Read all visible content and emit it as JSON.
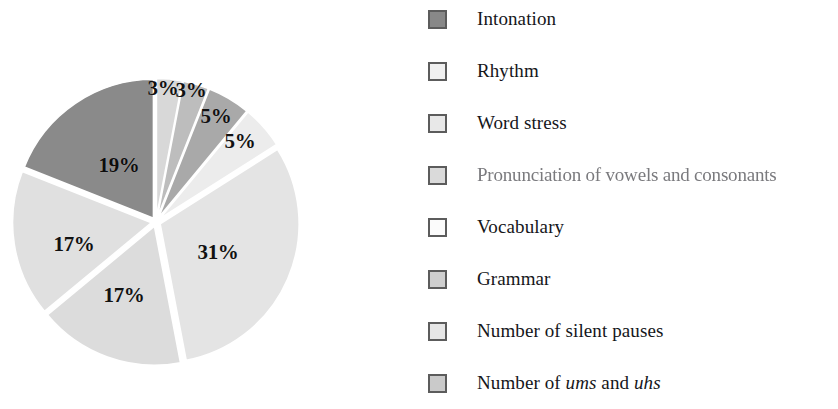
{
  "figure": {
    "background_color": "#ffffff"
  },
  "chart_data": {
    "type": "pie",
    "title": "",
    "subtitle": "",
    "xlabel": "",
    "ylabel": "",
    "grid": false,
    "legend_position": "right",
    "units": "percent",
    "total": 100,
    "start_angle_deg": 0,
    "direction": "clockwise",
    "exploded": true,
    "categories": [
      "Intonation",
      "Rhythm",
      "Word stress",
      "Pronunciation of vowels and consonants",
      "Vocabulary",
      "Grammar",
      "Number of silent pauses",
      "Number of ums and uhs"
    ],
    "values": [
      3,
      3,
      5,
      5,
      31,
      17,
      17,
      19
    ],
    "data_labels": [
      "3%",
      "3%",
      "5%",
      "5%",
      "31%",
      "17%",
      "17%",
      "19%"
    ],
    "colors": [
      "#d8d8d8",
      "#bdbdbd",
      "#a9a9a9",
      "#ececec",
      "#e4e4e4",
      "#dcdcdc",
      "#e0e0e0",
      "#8a8a8a"
    ],
    "slices": [
      {
        "label": "Intonation",
        "value": 3,
        "data_label": "3%",
        "color": "#d8d8d8"
      },
      {
        "label": "Rhythm",
        "value": 3,
        "data_label": "3%",
        "color": "#bdbdbd"
      },
      {
        "label": "Word stress",
        "value": 5,
        "data_label": "5%",
        "color": "#a9a9a9"
      },
      {
        "label": "Pronunciation of vowels and consonants",
        "value": 5,
        "data_label": "5%",
        "color": "#ececec"
      },
      {
        "label": "Vocabulary",
        "value": 31,
        "data_label": "31%",
        "color": "#e4e4e4"
      },
      {
        "label": "Grammar",
        "value": 17,
        "data_label": "17%",
        "color": "#dcdcdc"
      },
      {
        "label": "Number of silent pauses",
        "value": 17,
        "data_label": "17%",
        "color": "#e0e0e0"
      },
      {
        "label": "Number of ums and uhs",
        "value": 19,
        "data_label": "19%",
        "color": "#8a8a8a"
      }
    ]
  },
  "pie": {
    "center_x": 156,
    "center_y": 167,
    "radius": 139,
    "labels": [
      {
        "text": "3%",
        "x": 163,
        "y": 33
      },
      {
        "text": "3%",
        "x": 191,
        "y": 35
      },
      {
        "text": "5%",
        "x": 216,
        "y": 61
      },
      {
        "text": "5%",
        "x": 240,
        "y": 86
      },
      {
        "text": "31%",
        "x": 218,
        "y": 197
      },
      {
        "text": "17%",
        "x": 124,
        "y": 240
      },
      {
        "text": "17%",
        "x": 74,
        "y": 189
      },
      {
        "text": "19%",
        "x": 119,
        "y": 110
      }
    ]
  },
  "legend": {
    "items": [
      {
        "label": "Intonation",
        "swatch_color": "#888888",
        "y": 6,
        "faded": false,
        "italic_words": []
      },
      {
        "label": "Rhythm",
        "swatch_color": "#f0f0f0",
        "y": 58,
        "faded": false,
        "italic_words": []
      },
      {
        "label": "Word stress",
        "swatch_color": "#e8e8e8",
        "y": 110,
        "faded": false,
        "italic_words": []
      },
      {
        "label": "Pronunciation of vowels and consonants",
        "swatch_color": "#dadada",
        "y": 162,
        "faded": true,
        "italic_words": []
      },
      {
        "label": "Vocabulary",
        "swatch_color": "#fbfbfb",
        "y": 214,
        "faded": false,
        "italic_words": []
      },
      {
        "label": "Grammar",
        "swatch_color": "#cfcfcf",
        "y": 266,
        "faded": false,
        "italic_words": []
      },
      {
        "label": "Number of silent pauses",
        "swatch_color": "#e6e6e6",
        "y": 318,
        "faded": false,
        "italic_words": []
      },
      {
        "label": "Number of ums and uhs",
        "swatch_color": "#cacaca",
        "y": 370,
        "faded": false,
        "italic_words": [
          "ums",
          "uhs"
        ]
      }
    ]
  }
}
